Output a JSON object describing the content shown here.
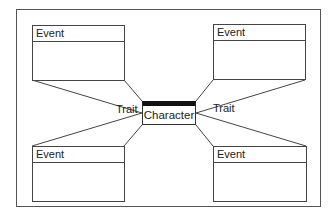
{
  "diagram": {
    "center": {
      "label": "Character"
    },
    "traits": [
      {
        "label": "Trait",
        "side": "left"
      },
      {
        "label": "Trait",
        "side": "right"
      }
    ],
    "events": [
      {
        "label": "Event",
        "position": "top-left"
      },
      {
        "label": "Event",
        "position": "top-right"
      },
      {
        "label": "Event",
        "position": "bottom-left"
      },
      {
        "label": "Event",
        "position": "bottom-right"
      }
    ],
    "colors": {
      "line": "#444444",
      "center_bar": "#111111",
      "background": "#ffffff"
    }
  }
}
